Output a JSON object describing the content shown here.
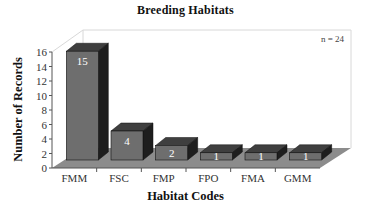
{
  "chart_data": {
    "type": "bar",
    "title": "Breeding Habitats",
    "xlabel": "Habitat Codes",
    "ylabel": "Number of Records",
    "categories": [
      "FMM",
      "FSC",
      "FMP",
      "FPO",
      "FMA",
      "GMM"
    ],
    "values": [
      15,
      4,
      2,
      1,
      1,
      1
    ],
    "value_labels": [
      "15",
      "4",
      "2",
      "1",
      "1",
      "1"
    ],
    "ylim": [
      0,
      16
    ],
    "yticks": [
      0,
      2,
      4,
      6,
      8,
      10,
      12,
      14,
      16
    ],
    "annotation": "n = 24",
    "grid": false,
    "style": "3d",
    "legend": null
  },
  "colors": {
    "bar_front": "#6e6e6e",
    "bar_top": "#3f3f3f",
    "bar_side": "#1e1e1e",
    "floor": "#8c8c8c",
    "wall_line": "#d8d8d8",
    "axis": "#555555"
  }
}
